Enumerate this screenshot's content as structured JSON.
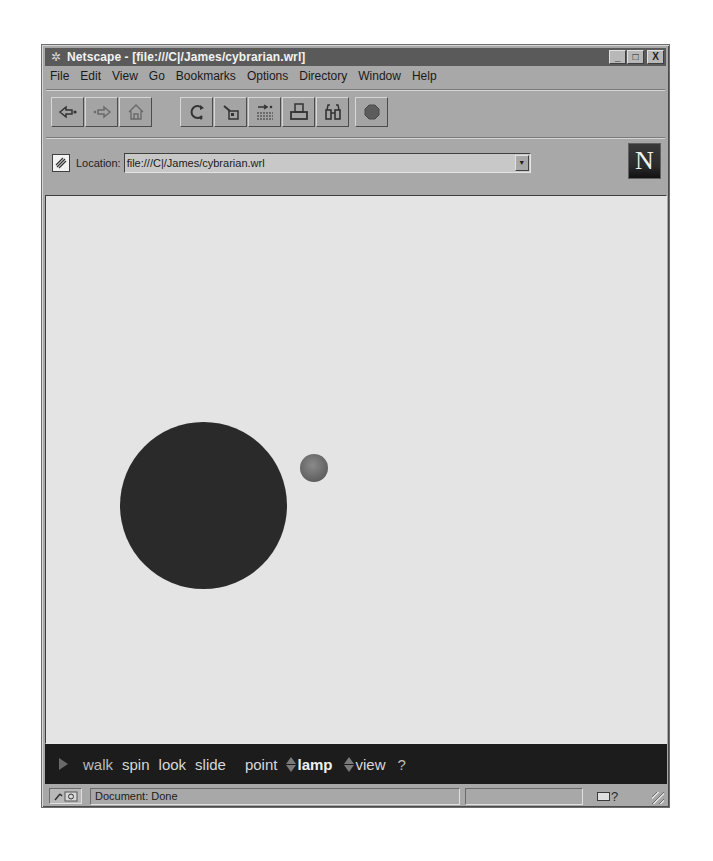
{
  "window": {
    "title": "Netscape - [file:///C|/James/cybrarian.wrl]",
    "controls": {
      "minimize": "_",
      "maximize": "□",
      "close": "X"
    }
  },
  "menubar": {
    "items": [
      {
        "label": "File",
        "accel": "F"
      },
      {
        "label": "Edit",
        "accel": "E"
      },
      {
        "label": "View",
        "accel": "V"
      },
      {
        "label": "Go",
        "accel": "G"
      },
      {
        "label": "Bookmarks",
        "accel": "B"
      },
      {
        "label": "Options",
        "accel": "O"
      },
      {
        "label": "Directory",
        "accel": "D"
      },
      {
        "label": "Window",
        "accel": "W"
      },
      {
        "label": "Help",
        "accel": "H"
      }
    ]
  },
  "toolbar": {
    "buttons": [
      {
        "name": "back",
        "icon": "back-arrow-icon"
      },
      {
        "name": "forward",
        "icon": "forward-arrow-icon"
      },
      {
        "name": "home",
        "icon": "home-icon"
      },
      {
        "name": "reload",
        "icon": "reload-icon"
      },
      {
        "name": "images",
        "icon": "images-icon"
      },
      {
        "name": "open",
        "icon": "open-icon"
      },
      {
        "name": "print",
        "icon": "print-icon"
      },
      {
        "name": "find",
        "icon": "binoculars-icon"
      },
      {
        "name": "stop",
        "icon": "stop-icon"
      }
    ]
  },
  "location": {
    "label": "Location:",
    "value": "file:///C|/James/cybrarian.wrl",
    "logo": "N"
  },
  "scene": {
    "background": "#e4e4e4",
    "objects": [
      {
        "shape": "sphere",
        "size": "large",
        "color": "#2a2a2a"
      },
      {
        "shape": "sphere",
        "size": "small",
        "color": "#6a6a6a"
      }
    ]
  },
  "vrml_nav": {
    "items": [
      "walk",
      "spin",
      "look",
      "slide"
    ],
    "point": "point",
    "lamp": "lamp",
    "view": "view",
    "help": "?"
  },
  "statusbar": {
    "security": "🔑",
    "text": "Document: Done",
    "mail": "?"
  }
}
